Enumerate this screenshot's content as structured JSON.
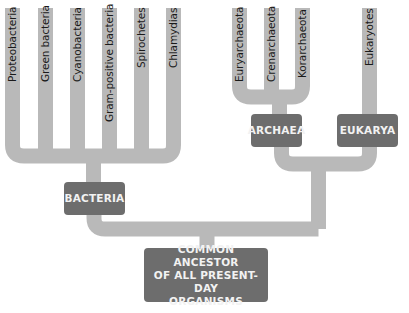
{
  "diagram": {
    "type": "phylogenetic-tree",
    "colors": {
      "branch": "#b9b9b9",
      "box": "#6d6d6d",
      "box_text": "#f2f2f2",
      "label_text": "#1a1a1a"
    },
    "domains": {
      "bacteria": {
        "label": "BACTERIA",
        "leaves": [
          "Proteobacteria",
          "Green bacteria",
          "Cyanobacteria",
          "Gram-positive bacteria",
          "Spirochetes",
          "Chlamydias"
        ]
      },
      "archaea": {
        "label": "ARCHAEA",
        "leaves": [
          "Euryarchaeota",
          "Crenarchaeota",
          "Korarchaeota"
        ]
      },
      "eukarya": {
        "label": "EUKARYA",
        "leaves": [
          "Eukaryotes"
        ]
      }
    },
    "root": {
      "line1": "COMMON ANCESTOR",
      "line2": "OF ALL PRESENT-DAY",
      "line3": "ORGANISMS"
    }
  }
}
